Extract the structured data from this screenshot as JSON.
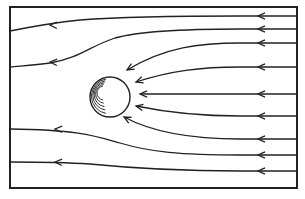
{
  "diagram": {
    "frame": {
      "x": 10,
      "y": 7,
      "width": 287,
      "height": 181,
      "stroke": "#222222"
    },
    "sphere": {
      "cx": 110,
      "cy": 97,
      "r": 20,
      "label": "sphere"
    },
    "flow_direction": "right-to-left",
    "streamlines": [
      {
        "id": "s1",
        "path": "M297,16 L240,16 C160,16 120,17 80,20 C50,23 30,27 10,31",
        "arrow_at": [
          258,
          16
        ],
        "arrow2_at": [
          50,
          25
        ]
      },
      {
        "id": "s2",
        "path": "M297,29 L240,29 C180,29 140,31 115,38 C90,46 80,58 50,63 C35,65 20,66 10,67",
        "arrow_at": [
          258,
          29
        ],
        "arrow2_at": [
          50,
          62
        ]
      },
      {
        "id": "s3",
        "path": "M297,43 L240,43 C200,43 165,47 127,70",
        "arrow_at": [
          258,
          43
        ],
        "end_arrow": true
      },
      {
        "id": "s4",
        "path": "M297,67 L240,67 C200,67 170,71 136,82",
        "arrow_at": [
          258,
          67
        ],
        "end_arrow": true
      },
      {
        "id": "s5",
        "path": "M297,94 L240,94 L140,94",
        "arrow_at": [
          258,
          94
        ],
        "end_arrow": true
      },
      {
        "id": "s6",
        "path": "M297,116 L240,116 C195,116 165,112 136,106",
        "arrow_at": [
          258,
          116
        ],
        "end_arrow": true
      },
      {
        "id": "s7",
        "path": "M297,139 L240,139 C185,139 150,131 124,117",
        "arrow_at": [
          258,
          139
        ],
        "end_arrow": true
      },
      {
        "id": "s8",
        "path": "M297,155 L240,155 C180,155 150,152 120,143 C95,136 80,130 10,129",
        "arrow_at": [
          258,
          155
        ],
        "arrow2_at": [
          55,
          129
        ]
      },
      {
        "id": "s9",
        "path": "M297,171 L240,171 C170,171 130,168 90,164 C60,162 35,162 10,162",
        "arrow_at": [
          258,
          171
        ],
        "arrow2_at": [
          55,
          162
        ]
      }
    ]
  },
  "caption": {
    "text": ""
  }
}
